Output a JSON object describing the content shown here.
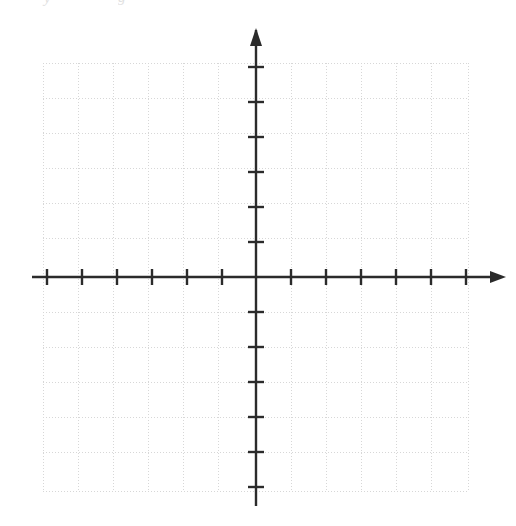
{
  "figure": {
    "kind": "blank-cartesian-coordinate-grid",
    "title": "",
    "has_axis_labels": false,
    "has_tick_number_labels": false,
    "has_plotted_data": false,
    "background_color": "#ffffff"
  },
  "scan_artifacts": {
    "note": "faint clipped text remnants at the top edge of the scan",
    "fragment_left": "y",
    "fragment_right": "g"
  },
  "grid": {
    "color": "#d7d7d7",
    "style": "dotted",
    "left_px": 43,
    "top_px": 63,
    "right_px": 468,
    "bottom_px": 491,
    "cell_size_px": 35,
    "columns": 12,
    "rows": 12,
    "x_lines_px": [
      43,
      78,
      113,
      148,
      183,
      218,
      256,
      291,
      326,
      361,
      396,
      431,
      468
    ],
    "y_lines_px": [
      63,
      98,
      133,
      168,
      203,
      238,
      277,
      312,
      347,
      382,
      417,
      452,
      491
    ]
  },
  "axes": {
    "color": "#2b2b2b",
    "stroke_width": 2.4,
    "origin_x_px": 256,
    "origin_y_px": 277,
    "tick_spacing_px": 35,
    "tick_half_length_px": 8,
    "x_axis": {
      "name": "x-axis",
      "start_px": 32,
      "end_px": 498,
      "arrow_positive": true,
      "arrow_negative": false,
      "ticks_negative": 6,
      "ticks_positive": 6,
      "tick_positions_px": [
        47,
        82,
        117,
        152,
        187,
        222,
        291,
        326,
        361,
        396,
        431,
        466
      ]
    },
    "y_axis": {
      "name": "y-axis",
      "start_px": 30,
      "end_px": 506,
      "arrow_positive": true,
      "arrow_negative": false,
      "ticks_positive": 6,
      "ticks_negative": 6,
      "tick_positions_px": [
        67,
        102,
        137,
        172,
        207,
        242,
        312,
        347,
        382,
        417,
        452,
        487
      ]
    }
  }
}
